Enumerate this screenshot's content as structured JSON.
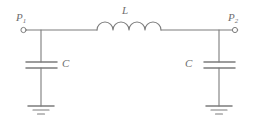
{
  "figure": {
    "kind": "circuit-diagram",
    "title_visible": false,
    "stroke_color": "#7c7c7c",
    "label_color": "#6e6e6e",
    "background_color": "#ffffff",
    "width": 260,
    "height": 130
  },
  "labels": {
    "port_left": "P",
    "port_left_sub": "1",
    "port_right": "P",
    "port_right_sub": "2",
    "inductor": "L",
    "capacitor_left": "C",
    "capacitor_right": "C"
  },
  "components": [
    {
      "name": "port-p1",
      "type": "terminal",
      "label": "P1",
      "x": 23,
      "y": 30
    },
    {
      "name": "port-p2",
      "type": "terminal",
      "label": "P2",
      "x": 235,
      "y": 30
    },
    {
      "name": "inductor-l",
      "type": "inductor",
      "label": "L",
      "coils": 4,
      "x1": 97,
      "y1": 30,
      "x2": 161,
      "y2": 30
    },
    {
      "name": "capacitor-c1",
      "type": "capacitor",
      "label": "C",
      "x": 41,
      "plate_top_y": 62,
      "plate_bottom_y": 68
    },
    {
      "name": "capacitor-c2",
      "type": "capacitor",
      "label": "C",
      "x": 219,
      "plate_top_y": 62,
      "plate_bottom_y": 68
    },
    {
      "name": "ground-left",
      "type": "ground",
      "x": 41,
      "y": 106
    },
    {
      "name": "ground-right",
      "type": "ground",
      "x": 219,
      "y": 106
    }
  ]
}
